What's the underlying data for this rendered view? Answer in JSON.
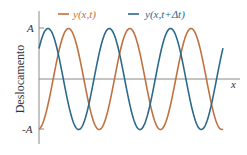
{
  "chart_data": {
    "type": "line",
    "title": "",
    "xlabel": "x",
    "ylabel": "Deslocamento",
    "yticks": [
      "A",
      "-A"
    ],
    "ylim": [
      -1,
      1
    ],
    "grid": false,
    "legend_position": "top",
    "series": [
      {
        "name": "y(x,t)",
        "color": "#c0713f",
        "function": "sinusoid, amplitude A, ~3 periods visible, starts near -A at x=0",
        "phase_offset_periods": 0.0
      },
      {
        "name": "y(x,t+Δt)",
        "color": "#2b6a8a",
        "function": "sinusoid, amplitude A, same wavelength, shifted left ~1/3 period relative to y(x,t)",
        "phase_offset_periods": 0.33
      }
    ]
  },
  "legend": {
    "series0": "y(x,t)",
    "series1": "y(x,t+Δt)"
  },
  "axes": {
    "x_label": "x",
    "y_label": "Deslocamento",
    "tick_top": "A",
    "tick_bottom": "-A"
  },
  "colors": {
    "orange": "#c0713f",
    "blue": "#2b6a8a",
    "axis": "#707070"
  }
}
